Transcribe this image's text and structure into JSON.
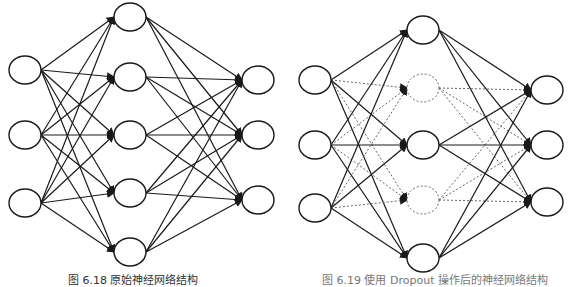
{
  "figures": [
    {
      "id": "original-network",
      "caption": "图 6.18  原始神经网络结构",
      "layers": {
        "input": {
          "x": 25,
          "ys": [
            70,
            135,
            203
          ],
          "dropped": [
            false,
            false,
            false
          ]
        },
        "hidden": {
          "x": 130,
          "ys": [
            17,
            77,
            135,
            193,
            252
          ],
          "dropped": [
            false,
            false,
            false,
            false,
            false
          ]
        },
        "output": {
          "x": 258,
          "ys": [
            80,
            135,
            200
          ],
          "dropped": [
            false,
            false,
            false
          ]
        }
      },
      "node_radius_x": 16,
      "node_radius_y": 14
    },
    {
      "id": "dropout-network",
      "caption": "图 6.19  使用 Dropout 操作后的神经网络结构",
      "layers": {
        "input": {
          "x": 315,
          "ys": [
            80,
            145,
            208
          ],
          "dropped": [
            false,
            false,
            false
          ]
        },
        "hidden": {
          "x": 423,
          "ys": [
            30,
            88,
            145,
            200,
            258
          ],
          "dropped": [
            false,
            true,
            false,
            true,
            false
          ]
        },
        "output": {
          "x": 547,
          "ys": [
            90,
            145,
            202
          ],
          "dropped": [
            false,
            false,
            false
          ]
        }
      },
      "node_radius_x": 16,
      "node_radius_y": 14
    }
  ],
  "colors": {
    "stroke": "#1a1a1a",
    "dropped_stroke": "#666666",
    "background": "#ffffff"
  }
}
